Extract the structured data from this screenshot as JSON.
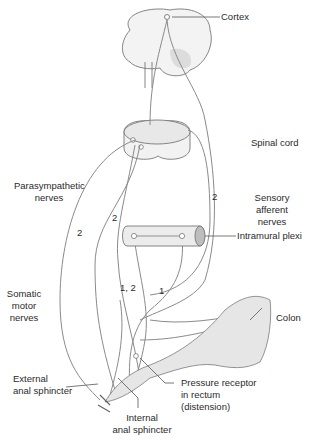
{
  "diagram": {
    "labels": {
      "cortex": "Cortex",
      "spinal_cord": "Spinal cord",
      "parasympathetic_1": "Parasympathetic",
      "parasympathetic_2": "nerves",
      "sensory_1": "Sensory",
      "sensory_2": "afferent",
      "sensory_3": "nerves",
      "intramural": "Intramural plexi",
      "somatic_1": "Somatic",
      "somatic_2": "motor",
      "somatic_3": "nerves",
      "colon": "Colon",
      "external_1": "External",
      "external_2": "anal sphincter",
      "pressure_1": "Pressure receptor",
      "pressure_2": "in rectum",
      "pressure_3": "(distension)",
      "internal_1": "Internal",
      "internal_2": "anal sphincter"
    },
    "pathway_numbers": {
      "sensory_2": "2",
      "para_2": "2",
      "left_2": "2",
      "one_two": "1, 2",
      "one": "1"
    },
    "colors": {
      "line": "#8a8a8a",
      "fill": "#e6e6e6",
      "text": "#2a2a2a"
    }
  }
}
